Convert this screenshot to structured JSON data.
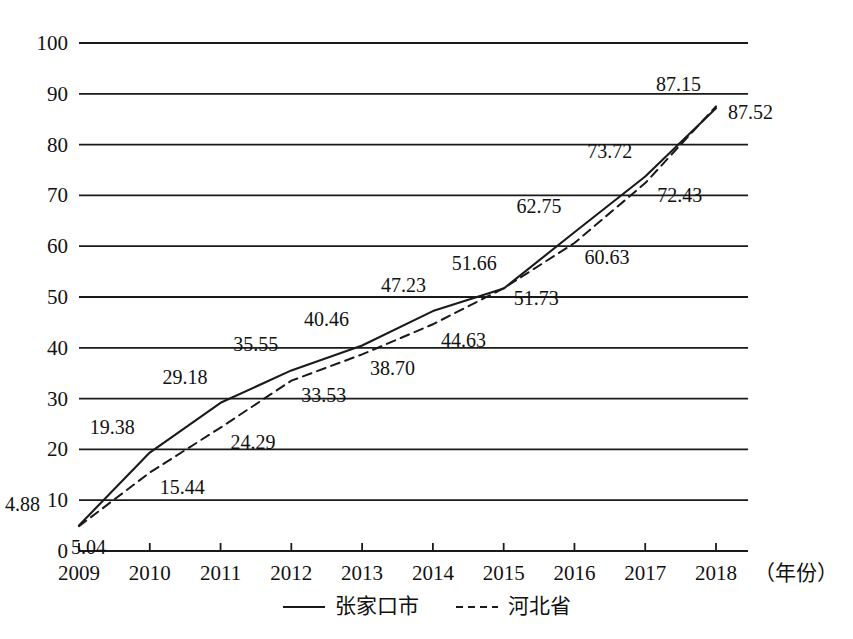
{
  "chart_data": {
    "type": "line",
    "title": "",
    "subtitle": "",
    "xlabel": "（年份）",
    "ylabel": "",
    "x": [
      2009,
      2010,
      2011,
      2012,
      2013,
      2014,
      2015,
      2016,
      2017,
      2018
    ],
    "categories": [
      "2009",
      "2010",
      "2011",
      "2012",
      "2013",
      "2014",
      "2015",
      "2016",
      "2017",
      "2018"
    ],
    "xlim": [
      2009,
      2018
    ],
    "ylim": [
      0,
      100
    ],
    "yticks": [
      0,
      10,
      20,
      30,
      40,
      50,
      60,
      70,
      80,
      90,
      100
    ],
    "ytick_labels": [
      "0",
      "10",
      "20",
      "30",
      "40",
      "50",
      "60",
      "70",
      "80",
      "90",
      "100"
    ],
    "grid": "horizontal",
    "legend_position": "bottom-center",
    "series": [
      {
        "name": "张家口市",
        "style": "solid",
        "color": "#1a1a1a",
        "values": [
          5.04,
          19.38,
          29.18,
          35.55,
          40.46,
          47.23,
          51.66,
          62.75,
          73.72,
          87.15
        ],
        "labels": [
          "5.04",
          "19.38",
          "29.18",
          "35.55",
          "40.46",
          "47.23",
          "51.66",
          "62.75",
          "73.72",
          "87.15"
        ]
      },
      {
        "name": "河北省",
        "style": "dashed",
        "color": "#1a1a1a",
        "values": [
          4.88,
          15.44,
          24.29,
          33.53,
          38.7,
          44.63,
          51.73,
          60.63,
          72.43,
          87.52
        ],
        "labels": [
          "4.88",
          "15.44",
          "24.29",
          "33.53",
          "38.70",
          "44.63",
          "51.73",
          "60.63",
          "72.43",
          "87.52"
        ]
      }
    ]
  },
  "legend": {
    "items": [
      {
        "label": "张家口市",
        "style": "solid"
      },
      {
        "label": "河北省",
        "style": "dashed"
      }
    ]
  },
  "axis": {
    "x_unit_label": "（年份）"
  }
}
